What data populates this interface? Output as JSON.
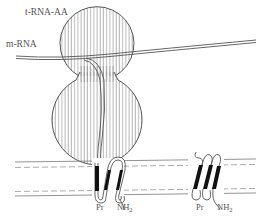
{
  "diagram": {
    "type": "ribosome-membrane-protein-translocation",
    "labels": {
      "trna": "t-RNA-AA",
      "mrna": "m-RNA",
      "left_pr": "Pr",
      "left_nh": "NH",
      "left_nh_sub": "2",
      "right_pr": "Pr",
      "right_nh": "NH",
      "right_nh_sub": "2"
    },
    "colors": {
      "line": "#555555",
      "hatch": "#8a8a8a",
      "helix_fill": "#111111",
      "background": "#ffffff"
    },
    "components": [
      "small ribosomal subunit (upper, hatched)",
      "large ribosomal subunit (lower, hatched)",
      "m-RNA strand",
      "nascent polypeptide chain",
      "membrane bilayer (solid + dashed lines)",
      "transmembrane helices (left, under ribosome)",
      "transmembrane helices (right, free)"
    ]
  }
}
